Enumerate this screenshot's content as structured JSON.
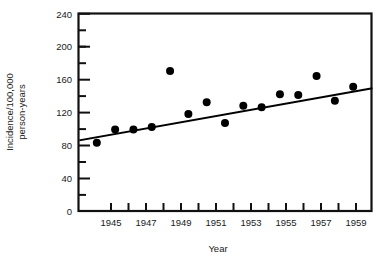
{
  "chart_data": {
    "type": "scatter",
    "title": "",
    "subtitle": "",
    "xlabel": "Year",
    "ylabel_line1": "Incidence/100,000",
    "ylabel_line2": "person-years",
    "ylabel": "Incidence/100,000 person-years",
    "xlim": [
      1944,
      1960
    ],
    "ylim": [
      0,
      240
    ],
    "y_major_ticks": [
      0,
      40,
      80,
      120,
      160,
      200,
      240
    ],
    "y_major_tick_labels": [
      "0",
      "40",
      "80",
      "120",
      "160",
      "200",
      "240"
    ],
    "y_minor_ticks": [
      20,
      60,
      100,
      140,
      180,
      220
    ],
    "x_ticks": [
      1945,
      1946,
      1947,
      1948,
      1949,
      1950,
      1951,
      1952,
      1953,
      1954,
      1955,
      1956,
      1957,
      1958,
      1959
    ],
    "x_tick_labels": [
      "1945",
      "",
      "1947",
      "",
      "1949",
      "",
      "1951",
      "",
      "1953",
      "",
      "1955",
      "",
      "1957",
      "",
      "1959"
    ],
    "x_labeled_ticks": [
      "1945",
      "1947",
      "1949",
      "1951",
      "1953",
      "1955",
      "1957",
      "1959"
    ],
    "grid": false,
    "legend": null,
    "legend_position": "none",
    "x": [
      1945,
      1946,
      1947,
      1948,
      1949,
      1950,
      1951,
      1952,
      1953,
      1954,
      1955,
      1956,
      1957,
      1958,
      1959
    ],
    "values": [
      83,
      99,
      99,
      102,
      170,
      118,
      132,
      107,
      128,
      126,
      142,
      141,
      164,
      134,
      151
    ],
    "series": [
      {
        "name": "Incidence",
        "marker": "filled-circle",
        "color": "#000000",
        "values": [
          83,
          99,
          99,
          102,
          170,
          118,
          132,
          107,
          128,
          126,
          142,
          141,
          164,
          134,
          151
        ]
      }
    ],
    "trendline": {
      "type": "linear-fit",
      "color": "#000000",
      "x_start": 1944.1,
      "y_start": 86,
      "x_end": 1960.0,
      "y_end": 149
    }
  },
  "axes": {
    "x_axis_name": "Year",
    "y_axis_name": "Incidence/100,000 person-years"
  }
}
